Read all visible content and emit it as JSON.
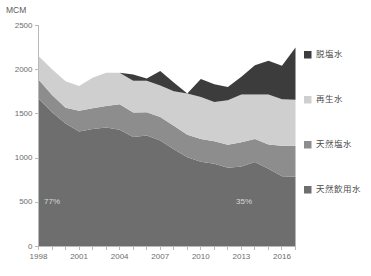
{
  "chart_data": {
    "type": "area",
    "stacked": true,
    "title": "",
    "xlabel": "",
    "ylabel": "MCM",
    "unit": "MCM",
    "grid": false,
    "legend_position": "right",
    "xlim": [
      1998,
      2017
    ],
    "ylim": [
      0,
      2500
    ],
    "yticks": [
      0,
      500,
      1000,
      1500,
      2000,
      2500
    ],
    "xticks": [
      1998,
      2001,
      2004,
      2007,
      2010,
      2013,
      2016
    ],
    "x": [
      1998,
      1999,
      2000,
      2001,
      2002,
      2003,
      2004,
      2005,
      2006,
      2007,
      2008,
      2009,
      2010,
      2011,
      2012,
      2013,
      2014,
      2015,
      2016,
      2017
    ],
    "series": [
      {
        "name": "天然飲用水",
        "color": "#6e6e6e",
        "values": [
          1670,
          1520,
          1390,
          1300,
          1330,
          1345,
          1320,
          1240,
          1255,
          1200,
          1100,
          1010,
          960,
          935,
          890,
          905,
          955,
          880,
          795,
          790
        ]
      },
      {
        "name": "天然塩水",
        "color": "#8d8d8d",
        "values": [
          220,
          195,
          180,
          235,
          235,
          245,
          290,
          275,
          265,
          265,
          265,
          255,
          255,
          255,
          260,
          275,
          260,
          275,
          345,
          350
        ]
      },
      {
        "name": "再生水",
        "color": "#cfcfcf",
        "values": [
          265,
          290,
          300,
          280,
          345,
          375,
          355,
          360,
          355,
          355,
          390,
          465,
          475,
          445,
          505,
          540,
          505,
          565,
          525,
          520
        ]
      },
      {
        "name": "脱塩水",
        "color": "#3c3c3c",
        "values": [
          0,
          0,
          0,
          0,
          0,
          0,
          0,
          70,
          25,
          165,
          100,
          0,
          205,
          200,
          150,
          200,
          330,
          380,
          380,
          590
        ]
      }
    ],
    "annotations": [
      {
        "text": "77%",
        "x": 1999,
        "y": 500,
        "name": "annotation-share-left"
      },
      {
        "text": "35%",
        "x": 2013.2,
        "y": 500,
        "name": "annotation-share-right"
      }
    ]
  },
  "legend": {
    "items": [
      {
        "label": "脱塩水",
        "color": "#3c3c3c"
      },
      {
        "label": "再生水",
        "color": "#cfcfcf"
      },
      {
        "label": "天然塩水",
        "color": "#8d8d8d"
      },
      {
        "label": "天然飲用水",
        "color": "#6e6e6e"
      }
    ]
  }
}
